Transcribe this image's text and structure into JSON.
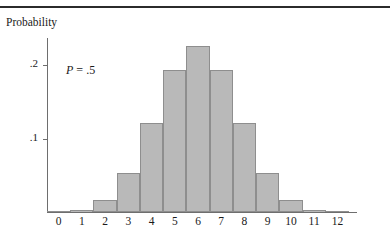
{
  "figure": {
    "y_axis_title": "Probability",
    "annotation": "P = .5",
    "annotation_symbol": "P",
    "annotation_equals": " = ",
    "annotation_value": ".5"
  },
  "chart_data": {
    "type": "bar",
    "title": "",
    "subtitle": "",
    "xlabel": "",
    "ylabel": "Probability",
    "categories": [
      "0",
      "1",
      "2",
      "3",
      "4",
      "5",
      "6",
      "7",
      "8",
      "9",
      "10",
      "11",
      "12"
    ],
    "values": [
      0.0002,
      0.0029,
      0.0161,
      0.0537,
      0.1208,
      0.1934,
      0.2256,
      0.1934,
      0.1208,
      0.0537,
      0.0161,
      0.0029,
      0.0002
    ],
    "ylim": [
      0,
      0.24
    ],
    "xlim": [
      -0.5,
      12.5
    ],
    "ytick_values": [
      0.1,
      0.2
    ],
    "ytick_labels": [
      ".1",
      ".2"
    ],
    "xtick_labels": [
      "0",
      "1",
      "2",
      "3",
      "4",
      "5",
      "6",
      "7",
      "8",
      "9",
      "10",
      "11",
      "12"
    ],
    "grid": false,
    "legend": null,
    "annotations": [
      {
        "text": "P = .5",
        "x": 2.0,
        "y": 0.185
      }
    ],
    "bar_fill_color": "#b9b9b9",
    "bar_edge_color": "#8e8e8e",
    "axis_color": "#6e6e6e",
    "text_color": "#1a1a1a",
    "distribution": "binomial n=12 p=.5"
  }
}
